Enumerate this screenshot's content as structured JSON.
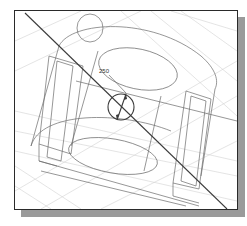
{
  "figure": {
    "type": "cad-wireframe",
    "dimension": {
      "label": "250"
    },
    "colors": {
      "frame_border": "#2a2a2a",
      "shadow": "#9a9a9a",
      "construction_grid": "#d2d2d2",
      "model_edges": "#6a6a6a",
      "active_sketch": "#3a3a3a"
    }
  }
}
